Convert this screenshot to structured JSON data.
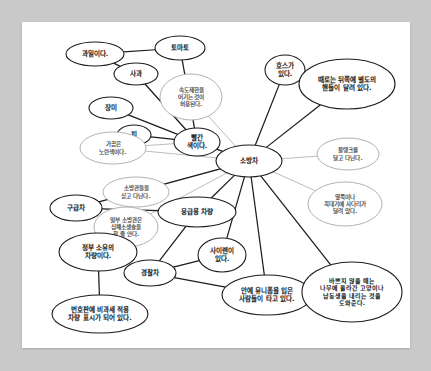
{
  "figure": {
    "type": "concept-map",
    "title": "소방차",
    "background_color": "#c9c9c9",
    "canvas_color": "#ffffff",
    "dark_edge_color": "#1c1c1c",
    "light_edge_color": "#bdbdbd"
  },
  "nodes": [
    {
      "id": "n_fruit",
      "label": "과일이다.",
      "style": "dark",
      "cx": 73,
      "cy": 32,
      "rx": 29,
      "ry": 12,
      "lines": [
        "과일이다."
      ]
    },
    {
      "id": "n_tomato",
      "label": "토마토",
      "style": "dark",
      "cx": 158,
      "cy": 26,
      "rx": 25,
      "ry": 12,
      "lines": [
        "토마토"
      ]
    },
    {
      "id": "n_apple",
      "label": "사과",
      "style": "dark",
      "cx": 114,
      "cy": 52,
      "rx": 22,
      "ry": 11,
      "lines": [
        "사과"
      ]
    },
    {
      "id": "n_rose",
      "label": "장미",
      "style": "dark",
      "cx": 89,
      "cy": 86,
      "rx": 22,
      "ry": 11,
      "lines": [
        "장미"
      ]
    },
    {
      "id": "n_blood",
      "label": "피",
      "style": "dark",
      "cx": 112,
      "cy": 113,
      "rx": 17,
      "ry": 10,
      "lines": [
        "피"
      ]
    },
    {
      "id": "n_red",
      "label": "빨간 색이다.",
      "style": "dark",
      "cx": 175,
      "cy": 120,
      "rx": 23,
      "ry": 14,
      "lines": [
        "빨간",
        "색이다."
      ]
    },
    {
      "id": "n_speed",
      "label": "속도제한을 어기는 것이 허용된다.",
      "style": "light",
      "cx": 169,
      "cy": 75,
      "rx": 31,
      "ry": 23,
      "lines": [
        "속도제한을",
        "어기는 것이",
        "허용된다."
      ]
    },
    {
      "id": "n_yellow",
      "label": "가끔은 노란색이다.",
      "style": "light",
      "cx": 91,
      "cy": 126,
      "rx": 33,
      "ry": 16,
      "lines": [
        "가끔은",
        "노란색이다."
      ]
    },
    {
      "id": "n_firetruck",
      "label": "소방차",
      "style": "dark",
      "cx": 227,
      "cy": 139,
      "rx": 33,
      "ry": 16,
      "lines": [
        "소방차"
      ]
    },
    {
      "id": "n_hose",
      "label": "호스가 있다.",
      "style": "dark",
      "cx": 263,
      "cy": 48,
      "rx": 20,
      "ry": 15,
      "lines": [
        "호스가",
        "있다."
      ]
    },
    {
      "id": "n_rearwheel",
      "label": "때로는 뒤쪽에 별도의 핸들이 달려 있다.",
      "style": "dark",
      "cx": 325,
      "cy": 62,
      "rx": 48,
      "ry": 25,
      "lines": [
        "때로는 뒤쪽에 별도의",
        "핸들이 달려 있다."
      ]
    },
    {
      "id": "n_watertank",
      "label": "물탱크를 달고 다닌다.",
      "style": "light",
      "cx": 326,
      "cy": 132,
      "rx": 31,
      "ry": 16,
      "lines": [
        "물탱크를",
        "달고 다닌다."
      ]
    },
    {
      "id": "n_ladder",
      "label": "옆쪽이나 꼭대기에 사다리가 달려 있다.",
      "style": "light",
      "cx": 323,
      "cy": 182,
      "rx": 37,
      "ry": 22,
      "lines": [
        "옆쪽이나",
        "꼭대기에 사다리가",
        "달려 있다."
      ]
    },
    {
      "id": "n_carries",
      "label": "소방관들을 싣고 다닌다.",
      "style": "light",
      "cx": 114,
      "cy": 170,
      "rx": 33,
      "ry": 15,
      "lines": [
        "소방관들을",
        "싣고 다닌다."
      ]
    },
    {
      "id": "n_ambulance",
      "label": "구급차",
      "style": "dark",
      "cx": 54,
      "cy": 186,
      "rx": 26,
      "ry": 13,
      "lines": [
        "구급차"
      ]
    },
    {
      "id": "n_cpr",
      "label": "일부 소방관은 심폐소생술을 할 줄 안다.",
      "style": "light",
      "cx": 104,
      "cy": 205,
      "rx": 32,
      "ry": 20,
      "lines": [
        "일부 소방관은",
        "심폐소생술을",
        "할 줄 안다."
      ]
    },
    {
      "id": "n_emergency",
      "label": "응급용 차량",
      "style": "dark",
      "cx": 175,
      "cy": 190,
      "rx": 39,
      "ry": 15,
      "lines": [
        "응급용 차량"
      ]
    },
    {
      "id": "n_siren",
      "label": "사이렌이 있다.",
      "style": "dark",
      "cx": 200,
      "cy": 233,
      "rx": 24,
      "ry": 17,
      "lines": [
        "사이렌이",
        "있다."
      ]
    },
    {
      "id": "n_police",
      "label": "경찰차",
      "style": "dark",
      "cx": 128,
      "cy": 251,
      "rx": 26,
      "ry": 13,
      "lines": [
        "경찰차"
      ]
    },
    {
      "id": "n_govt",
      "label": "정부 소유의 차량이다.",
      "style": "dark",
      "cx": 76,
      "cy": 230,
      "rx": 39,
      "ry": 19,
      "lines": [
        "정부 소유의",
        "차량이다."
      ]
    },
    {
      "id": "n_plate",
      "label": "번호판에 비과세 적용 차량 표시가 되어 있다.",
      "style": "dark",
      "cx": 78,
      "cy": 292,
      "rx": 48,
      "ry": 19,
      "lines": [
        "번호판에 비과세 적용",
        "차량 표시가 되어 있다."
      ]
    },
    {
      "id": "n_uniform",
      "label": "안에 유니폼을 입은 사람들이 타고 있다.",
      "style": "dark",
      "cx": 245,
      "cy": 273,
      "rx": 45,
      "ry": 20,
      "lines": [
        "안에 유니폼을 입은",
        "사람들이 타고 있다."
      ]
    },
    {
      "id": "n_cat",
      "label": "바쁘지 않을 때는 나무에 올라간 고양이나 남동생을 내리는 것을 도와준다.",
      "style": "dark",
      "cx": 330,
      "cy": 270,
      "rx": 50,
      "ry": 30,
      "lines": [
        "바쁘지 않을 때는",
        "나무에 올라간 고양이나",
        "남동생을 내리는 것을",
        "도와준다."
      ]
    }
  ],
  "edges": [
    {
      "from": "n_fruit",
      "to": "n_tomato",
      "style": "dark"
    },
    {
      "from": "n_fruit",
      "to": "n_apple",
      "style": "dark"
    },
    {
      "from": "n_apple",
      "to": "n_red",
      "style": "dark"
    },
    {
      "from": "n_tomato",
      "to": "n_red",
      "style": "dark"
    },
    {
      "from": "n_rose",
      "to": "n_red",
      "style": "dark"
    },
    {
      "from": "n_blood",
      "to": "n_red",
      "style": "dark"
    },
    {
      "from": "n_red",
      "to": "n_firetruck",
      "style": "dark"
    },
    {
      "from": "n_speed",
      "to": "n_firetruck",
      "style": "light"
    },
    {
      "from": "n_yellow",
      "to": "n_red",
      "style": "light"
    },
    {
      "from": "n_yellow",
      "to": "n_firetruck",
      "style": "light"
    },
    {
      "from": "n_hose",
      "to": "n_firetruck",
      "style": "dark"
    },
    {
      "from": "n_rearwheel",
      "to": "n_firetruck",
      "style": "dark"
    },
    {
      "from": "n_watertank",
      "to": "n_firetruck",
      "style": "light"
    },
    {
      "from": "n_ladder",
      "to": "n_firetruck",
      "style": "light"
    },
    {
      "from": "n_carries",
      "to": "n_firetruck",
      "style": "light"
    },
    {
      "from": "n_ambulance",
      "to": "n_firetruck",
      "style": "dark"
    },
    {
      "from": "n_cpr",
      "to": "n_firetruck",
      "style": "light"
    },
    {
      "from": "n_ambulance",
      "to": "n_emergency",
      "style": "dark"
    },
    {
      "from": "n_emergency",
      "to": "n_firetruck",
      "style": "dark"
    },
    {
      "from": "n_emergency",
      "to": "n_police",
      "style": "dark"
    },
    {
      "from": "n_siren",
      "to": "n_firetruck",
      "style": "dark"
    },
    {
      "from": "n_siren",
      "to": "n_police",
      "style": "dark"
    },
    {
      "from": "n_police",
      "to": "n_uniform",
      "style": "dark"
    },
    {
      "from": "n_uniform",
      "to": "n_firetruck",
      "style": "dark"
    },
    {
      "from": "n_cat",
      "to": "n_firetruck",
      "style": "dark"
    },
    {
      "from": "n_govt",
      "to": "n_plate",
      "style": "dark"
    }
  ]
}
